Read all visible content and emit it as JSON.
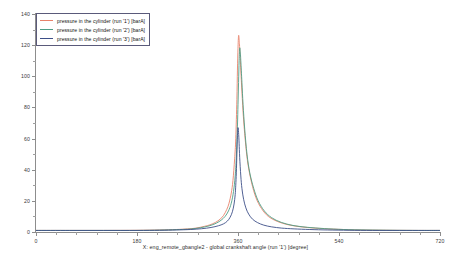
{
  "chart_data": {
    "type": "line",
    "title": "",
    "xlabel": "X: eng_remote_gbangle2 - global crankshaft angle (run '1') [degree]",
    "ylabel": "",
    "xlim": [
      0,
      720
    ],
    "ylim": [
      0,
      140
    ],
    "xticks": [
      0,
      180,
      360,
      540,
      720
    ],
    "yticks": [
      0,
      20,
      40,
      60,
      80,
      100,
      120,
      140
    ],
    "xtick_labels": [
      "0",
      "180",
      "360",
      "540",
      "720"
    ],
    "ytick_labels": [
      "0",
      "20",
      "40",
      "60",
      "80",
      "100",
      "120",
      "140"
    ],
    "x_minor_tick_interval": 36,
    "y_minor_tick_interval": 10,
    "grid": false,
    "legend_position": "upper-left",
    "units": "barA",
    "series": [
      {
        "name": "pressure in the cylinder (run '1') [barA]",
        "color": "#e8826b",
        "peak_x": 361,
        "peak_y": 126,
        "x": [
          0,
          60,
          120,
          180,
          220,
          250,
          270,
          285,
          300,
          310,
          320,
          328,
          334,
          340,
          344,
          348,
          351,
          354,
          356,
          358,
          359,
          360,
          361,
          362,
          363,
          365,
          367,
          370,
          374,
          378,
          384,
          392,
          402,
          414,
          430,
          450,
          475,
          505,
          540,
          580,
          630,
          680,
          720
        ],
        "y": [
          1.0,
          1.0,
          1.0,
          1.1,
          1.3,
          1.6,
          2.0,
          2.5,
          3.6,
          4.6,
          6.2,
          8.2,
          10.5,
          14.5,
          18.5,
          25.0,
          33.0,
          47.0,
          60.0,
          85.0,
          104.0,
          118.0,
          126.0,
          124.0,
          118.0,
          104.0,
          90.0,
          72.0,
          55.0,
          43.0,
          32.0,
          22.0,
          15.0,
          10.0,
          6.8,
          4.6,
          3.2,
          2.3,
          1.7,
          1.3,
          1.1,
          1.0,
          1.0
        ]
      },
      {
        "name": "pressure in the cylinder (run '2') [barA]",
        "color": "#4e9e86",
        "peak_x": 363,
        "peak_y": 118,
        "x": [
          0,
          60,
          120,
          180,
          220,
          250,
          270,
          285,
          300,
          312,
          322,
          330,
          337,
          343,
          348,
          352,
          355,
          357,
          359,
          360,
          361,
          362,
          363,
          364,
          365,
          367,
          369,
          372,
          376,
          381,
          388,
          396,
          407,
          420,
          437,
          458,
          484,
          514,
          548,
          588,
          635,
          682,
          720
        ],
        "y": [
          1.0,
          1.0,
          1.0,
          1.0,
          1.2,
          1.5,
          1.8,
          2.3,
          3.2,
          4.3,
          5.8,
          7.6,
          10.0,
          13.5,
          18.5,
          26.0,
          36.0,
          48.0,
          68.0,
          82.0,
          96.0,
          110.0,
          118.0,
          116.0,
          110.0,
          96.0,
          82.0,
          66.0,
          50.0,
          38.0,
          28.0,
          20.0,
          13.5,
          9.2,
          6.2,
          4.2,
          3.0,
          2.2,
          1.6,
          1.3,
          1.1,
          1.0,
          1.0
        ]
      },
      {
        "name": "pressure in the cylinder (run '3') [barA]",
        "color": "#3d4f88",
        "peak_x": 359,
        "peak_y": 67,
        "x": [
          0,
          60,
          120,
          180,
          220,
          250,
          275,
          295,
          312,
          325,
          334,
          341,
          346,
          350,
          353,
          355,
          356,
          357,
          358,
          359,
          360,
          361,
          362,
          363,
          365,
          367,
          370,
          374,
          379,
          386,
          395,
          406,
          420,
          438,
          460,
          488,
          520,
          558,
          600,
          648,
          692,
          720
        ],
        "y": [
          1.0,
          1.0,
          1.0,
          1.0,
          1.1,
          1.3,
          1.6,
          2.1,
          2.9,
          4.0,
          5.2,
          7.0,
          9.5,
          13.0,
          18.0,
          24.0,
          30.0,
          38.0,
          50.0,
          62.0,
          67.0,
          64.0,
          57.0,
          48.0,
          36.0,
          28.0,
          21.0,
          15.5,
          11.5,
          8.2,
          6.0,
          4.4,
          3.3,
          2.5,
          2.0,
          1.6,
          1.3,
          1.1,
          1.0,
          1.0,
          1.0,
          1.0
        ]
      }
    ]
  },
  "legend": {
    "entries": [
      {
        "label": "pressure in the cylinder (run '1') [barA]",
        "color": "#e8826b"
      },
      {
        "label": "pressure in the cylinder (run '2') [barA]",
        "color": "#4e9e86"
      },
      {
        "label": "pressure in the cylinder (run '3') [barA]",
        "color": "#3d4f88"
      }
    ]
  },
  "axis_caption": "X: eng_remote_gbangle2 - global crankshaft angle (run '1') [degree]"
}
